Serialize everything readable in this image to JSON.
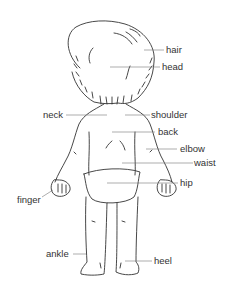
{
  "diagram": {
    "colors": {
      "outline": "#333333",
      "leader": "#777777",
      "text": "#333333",
      "background": "#ffffff"
    },
    "labels": {
      "hair": "hair",
      "head": "head",
      "neck": "neck",
      "shoulder": "shoulder",
      "back": "back",
      "elbow": "elbow",
      "waist": "waist",
      "hip": "hip",
      "finger": "finger",
      "ankle": "ankle",
      "heel": "heel"
    }
  }
}
